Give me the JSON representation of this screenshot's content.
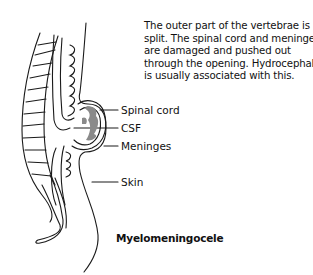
{
  "description": {
    "lines": [
      "The outer part of the vertebrae is",
      "split. The spinal cord and meninges",
      "are damaged and pushed out",
      "through the opening. Hydrocephalus",
      "is usually associated with this."
    ]
  },
  "labels": {
    "spinal_cord": "Spinal cord",
    "csf": "CSF",
    "meninges": "Meninges",
    "skin": "Skin"
  },
  "caption": "Myelomeningocele",
  "colors": {
    "line": "#1a1a1a",
    "fill_gray": "#8a8a8a",
    "background": "#ffffff"
  }
}
